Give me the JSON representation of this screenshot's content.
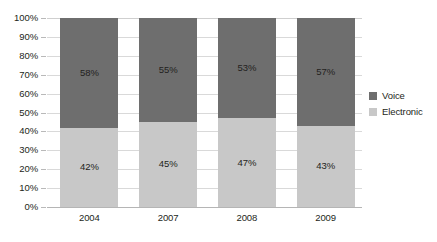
{
  "chart_data": {
    "type": "bar",
    "subtype": "stacked-100-percent",
    "title": "",
    "subtitle": "",
    "xlabel": "",
    "ylabel": "",
    "categories": [
      "2004",
      "2007",
      "2008",
      "2009"
    ],
    "series": [
      {
        "name": "Electronic",
        "color": "#c8c8c8",
        "stack_order": "bottom",
        "values": [
          42,
          45,
          47,
          43
        ],
        "labels": [
          "42%",
          "45%",
          "47%",
          "43%"
        ]
      },
      {
        "name": "Voice",
        "color": "#6e6e6e",
        "stack_order": "top",
        "values": [
          58,
          55,
          53,
          57
        ],
        "labels": [
          "58%",
          "55%",
          "53%",
          "57%"
        ]
      }
    ],
    "ylim": [
      0,
      100
    ],
    "ytick_values": [
      0,
      10,
      20,
      30,
      40,
      50,
      60,
      70,
      80,
      90,
      100
    ],
    "ytick_labels": [
      "0%",
      "10%",
      "20%",
      "30%",
      "40%",
      "50%",
      "60%",
      "70%",
      "80%",
      "90%",
      "100%"
    ],
    "grid": "horizontal",
    "legend_position": "right",
    "legend_entries": [
      "Voice",
      "Electronic"
    ],
    "background_color": "#ffffff"
  },
  "legend": {
    "items": [
      {
        "label": "Voice",
        "swatch": "voice-swatch"
      },
      {
        "label": "Electronic",
        "swatch": "electronic-swatch"
      }
    ]
  }
}
